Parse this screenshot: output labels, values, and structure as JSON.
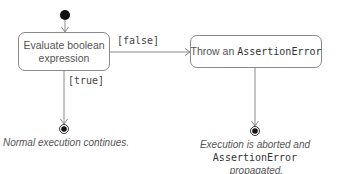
{
  "diagram": {
    "type": "UML activity diagram",
    "nodes": {
      "start": {
        "kind": "initial-node"
      },
      "evaluate": {
        "line1": "Evaluate boolean",
        "line2": "expression"
      },
      "throw": {
        "prefix": "Throw an ",
        "code": "AssertionError"
      },
      "end_normal": {
        "kind": "final-node"
      },
      "end_abort": {
        "kind": "final-node"
      }
    },
    "guards": {
      "false": "[false]",
      "true": "[true]"
    },
    "captions": {
      "normal": "Normal execution continues.",
      "abort_line1": "Execution is aborted and",
      "abort_code": "AssertionError",
      "abort_suffix": " propagated."
    },
    "colors": {
      "line": "#8a8a8a",
      "node_fill": "#111111",
      "text": "#555555"
    }
  }
}
